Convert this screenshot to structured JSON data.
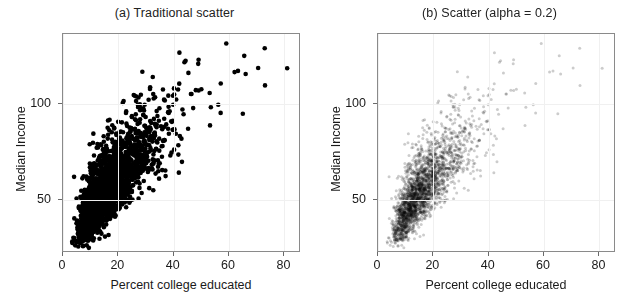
{
  "figure": {
    "width": 630,
    "height": 304,
    "background": "#ffffff"
  },
  "chart_data": {
    "type": "scatter",
    "title": "",
    "panels": [
      {
        "key": "a",
        "title": "(a) Traditional scatter",
        "xlabel": "Percent college educated",
        "ylabel": "Median Income",
        "xlim": [
          0,
          86
        ],
        "ylim": [
          22,
          137
        ],
        "xticks": [
          0,
          20,
          40,
          60,
          80
        ],
        "xticklabels": [
          "0",
          "20",
          "40",
          "60",
          "80"
        ],
        "yticks": [
          50,
          100
        ],
        "yticklabels": [
          "50",
          "100"
        ],
        "grid": true,
        "grid_color": "#f0f0f0",
        "marker": "circle",
        "marker_color": "#000000",
        "marker_alpha": 1.0,
        "marker_size_px": 4.6,
        "n_points": 2400
      },
      {
        "key": "b",
        "title": "(b) Scatter (alpha = 0.2)",
        "xlabel": "Percent college educated",
        "ylabel": "Median Income",
        "xlim": [
          0,
          86
        ],
        "ylim": [
          22,
          137
        ],
        "xticks": [
          0,
          20,
          40,
          60,
          80
        ],
        "xticklabels": [
          "0",
          "20",
          "40",
          "60",
          "80"
        ],
        "yticks": [
          50,
          100
        ],
        "yticklabels": [
          "50",
          "100"
        ],
        "grid": true,
        "grid_color": "#f0f0f0",
        "marker": "circle",
        "marker_color": "#000000",
        "marker_alpha": 0.2,
        "marker_size_px": 3.0,
        "n_points": 2400
      }
    ],
    "distribution": {
      "description": "Positively correlated cloud of US county-like observations; dense core at low percent-college / low-median-income, long right-skewed tail toward high education and high income.",
      "x_core_range": [
        7,
        26
      ],
      "y_core_range": [
        36,
        58
      ],
      "x_full_range": [
        2,
        82
      ],
      "y_full_range": [
        24,
        132
      ],
      "correlation": 0.68
    },
    "notable_points": [
      {
        "x": 59,
        "y": 132
      },
      {
        "x": 81,
        "y": 119
      },
      {
        "x": 73,
        "y": 110
      },
      {
        "x": 62,
        "y": 117
      },
      {
        "x": 66,
        "y": 116
      },
      {
        "x": 57,
        "y": 111
      },
      {
        "x": 50,
        "y": 108
      },
      {
        "x": 53,
        "y": 106
      },
      {
        "x": 29,
        "y": 98
      },
      {
        "x": 4,
        "y": 62
      }
    ]
  }
}
